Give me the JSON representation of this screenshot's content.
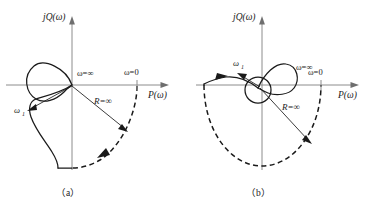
{
  "figure": {
    "kind": "nyquist-plot-pair",
    "background_color": "#ffffff",
    "axis_color": "#8c8c8c",
    "curve_color": "#1a1a1a",
    "width": 380,
    "height": 205
  },
  "panels": [
    {
      "id": "a",
      "caption": "（a）",
      "axes": {
        "vertical_label": "jQ(ω)",
        "horizontal_label": "P(ω)"
      },
      "annotations": {
        "omega_infinity": "ω=∞",
        "omega_zero": "ω=0",
        "radius": "R=∞",
        "omega_one_base": "ω",
        "omega_one_sub": "1"
      },
      "description": "Locus forms a loop in the second quadrant returning to the origin at omega equals infinity, then sweeps down through the third quadrant; a dashed infinite-radius arc closes the contour from the omega equals zero point on the positive real axis clockwise to the end of the locus."
    },
    {
      "id": "b",
      "caption": "（b）",
      "axes": {
        "vertical_label": "jQ(ω)",
        "horizontal_label": "P(ω)"
      },
      "annotations": {
        "omega_infinity": "ω=∞",
        "omega_zero": "ω=0",
        "radius": "R=∞",
        "omega_one_base": "ω",
        "omega_one_sub": "1"
      },
      "description": "Locus forms a small closed circle about the origin plus a larger lobe above the real axis, trailing left along the negative real axis with a flow arrow; a dashed infinite-radius semicircle closes the contour through the lower half plane."
    }
  ]
}
